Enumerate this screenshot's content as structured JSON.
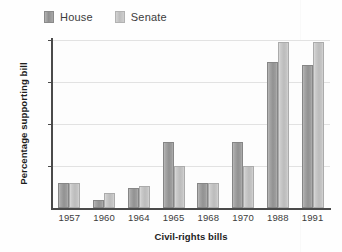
{
  "chart_data": {
    "type": "bar",
    "title": "",
    "xlabel": "Civil-rights bills",
    "ylabel": "Percentage supporting bill",
    "ylim": [
      0,
      100
    ],
    "yticks": [
      0,
      25,
      50,
      75,
      100
    ],
    "ytick_labels": [
      "",
      "25",
      "50",
      "75",
      "100"
    ],
    "grid": true,
    "legend_position": "top-left",
    "categories": [
      "1957",
      "1960",
      "1964",
      "1965",
      "1968",
      "1970",
      "1988",
      "1991"
    ],
    "series": [
      {
        "name": "House",
        "color": "#929292",
        "values": [
          15,
          5,
          12,
          39,
          15,
          39,
          87,
          85
        ]
      },
      {
        "name": "Senate",
        "color": "#bcbcbc",
        "values": [
          15,
          9,
          13,
          25,
          15,
          25,
          99,
          99
        ]
      }
    ]
  },
  "legend": {
    "items": [
      {
        "label": "House",
        "swatch": "house-swatch"
      },
      {
        "label": "Senate",
        "swatch": "senate-swatch"
      }
    ]
  },
  "axes": {
    "y_title": "Percentage supporting bill",
    "x_title": "Civil-rights bills",
    "y_ticks": [
      {
        "value": 100,
        "label": "100"
      },
      {
        "value": 75,
        "label": "75"
      },
      {
        "value": 50,
        "label": "50"
      },
      {
        "value": 25,
        "label": "25"
      }
    ],
    "x_ticks": [
      "1957",
      "1960",
      "1964",
      "1965",
      "1968",
      "1970",
      "1988",
      "1991"
    ]
  }
}
